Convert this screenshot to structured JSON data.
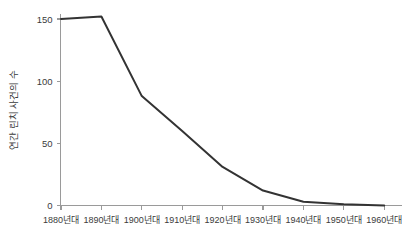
{
  "chart_data": {
    "type": "line",
    "title": "",
    "subtitle": "",
    "xlabel": "",
    "ylabel": "연간 린치 사건의 수",
    "categories": [
      "1880년대",
      "1890년대",
      "1900년대",
      "1910년대",
      "1920년대",
      "1930년대",
      "1940년대",
      "1950년대",
      "1960년대"
    ],
    "values": [
      150,
      152,
      88,
      60,
      31,
      12,
      3,
      1,
      0
    ],
    "series": [
      {
        "name": "연간 린치 사건의 수",
        "values": [
          150,
          152,
          88,
          60,
          31,
          12,
          3,
          1,
          0
        ],
        "color": "#333333"
      }
    ],
    "ylim": [
      0,
      158
    ],
    "yticks": [
      0,
      50,
      100,
      150
    ],
    "ytick_labels": [
      "0",
      "50",
      "100",
      "150"
    ],
    "grid": false,
    "legend": false,
    "legend_position": "none",
    "line_color": "#333333",
    "axis_color": "#9a9a9a",
    "background_color": "#ffffff",
    "markers": false,
    "annotations": []
  },
  "axes": {
    "y_title": "연간 린치 사건의 수"
  }
}
